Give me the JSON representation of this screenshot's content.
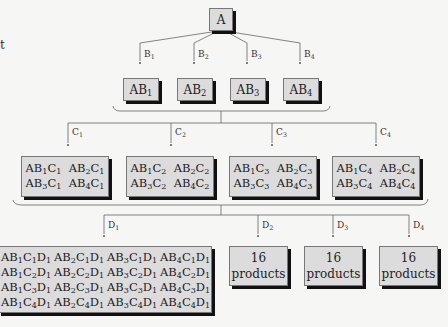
{
  "edge_fragment": "t",
  "root": {
    "label": "A"
  },
  "level_b": {
    "edge_labels": [
      "B",
      "B",
      "B",
      "B"
    ],
    "edge_subs": [
      "1",
      "2",
      "3",
      "4"
    ],
    "nodes": [
      {
        "base": "AB",
        "sub": "1"
      },
      {
        "base": "AB",
        "sub": "2"
      },
      {
        "base": "AB",
        "sub": "3"
      },
      {
        "base": "AB",
        "sub": "4"
      }
    ]
  },
  "level_c": {
    "edge_labels": [
      "C",
      "C",
      "C",
      "C"
    ],
    "edge_subs": [
      "1",
      "2",
      "3",
      "4"
    ],
    "nodes": [
      {
        "items": [
          [
            "1",
            "1"
          ],
          [
            "2",
            "1"
          ],
          [
            "3",
            "1"
          ],
          [
            "4",
            "1"
          ]
        ]
      },
      {
        "items": [
          [
            "1",
            "2"
          ],
          [
            "2",
            "2"
          ],
          [
            "3",
            "2"
          ],
          [
            "4",
            "2"
          ]
        ]
      },
      {
        "items": [
          [
            "1",
            "3"
          ],
          [
            "2",
            "3"
          ],
          [
            "3",
            "3"
          ],
          [
            "4",
            "3"
          ]
        ]
      },
      {
        "items": [
          [
            "1",
            "4"
          ],
          [
            "2",
            "4"
          ],
          [
            "3",
            "4"
          ],
          [
            "4",
            "4"
          ]
        ]
      }
    ]
  },
  "level_d": {
    "edge_labels": [
      "D",
      "D",
      "D",
      "D"
    ],
    "edge_subs": [
      "1",
      "2",
      "3",
      "4"
    ],
    "d1_products": [
      "AB1C1D1",
      "AB2C1D1",
      "AB3C1D1",
      "AB4C1D1",
      "AB1C2D1",
      "AB2C2D1",
      "AB3C2D1",
      "AB4C2D1",
      "AB1C3D1",
      "AB2C3D1",
      "AB3C3D1",
      "AB4C3D1",
      "AB1C4D1",
      "AB2C4D1",
      "AB3C4D1",
      "AB4C4D1"
    ],
    "summary_nodes": [
      {
        "count": "16",
        "label": "products"
      },
      {
        "count": "16",
        "label": "products"
      },
      {
        "count": "16",
        "label": "products"
      }
    ]
  }
}
